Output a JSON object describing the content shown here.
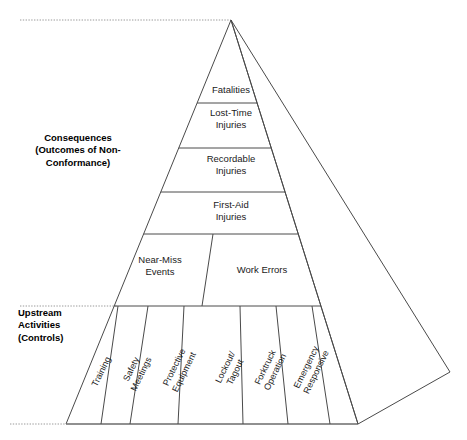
{
  "diagram": {
    "type": "pyramid",
    "line_color": "#4a4a4a",
    "guide_color": "#9a9a9a",
    "text_color": "#1a1a1a",
    "background": "#ffffff"
  },
  "side_labels": [
    {
      "name": "consequences",
      "align": "center",
      "x": 78,
      "y": 153,
      "lines": [
        "Consequences",
        "(Outcomes of Non-",
        "Conformance)"
      ]
    },
    {
      "name": "upstream",
      "align": "left",
      "x": 18,
      "y": 328,
      "lines": [
        "Upstream",
        "Activities",
        "(Controls)"
      ]
    }
  ],
  "tiers": [
    {
      "name": "fatalities",
      "lines": [
        "Fatalities"
      ],
      "cx": 231,
      "cy": 90
    },
    {
      "name": "lost-time-injuries",
      "lines": [
        "Lost-Time",
        "Injuries"
      ],
      "cx": 231,
      "cy": 119
    },
    {
      "name": "recordable-injuries",
      "lines": [
        "Recordable",
        "Injuries"
      ],
      "cx": 231,
      "cy": 165
    },
    {
      "name": "first-aid-injuries",
      "lines": [
        "First-Aid",
        "Injuries"
      ],
      "cx": 231,
      "cy": 211
    },
    {
      "name": "near-miss-events",
      "lines": [
        "Near-Miss",
        "Events"
      ],
      "cx": 160,
      "cy": 266
    },
    {
      "name": "work-errors",
      "lines": [
        "Work Errors"
      ],
      "cx": 262,
      "cy": 270
    }
  ],
  "columns": [
    {
      "name": "training",
      "lines": [
        "Training"
      ],
      "cx": 102,
      "cy": 372,
      "angle": -64
    },
    {
      "name": "safety-meetings",
      "lines": [
        "Safety",
        "Meetings"
      ],
      "cx": 137,
      "cy": 372,
      "angle": -64
    },
    {
      "name": "protective-equipment",
      "lines": [
        "Protective",
        "Equipment"
      ],
      "cx": 180,
      "cy": 370,
      "angle": -64
    },
    {
      "name": "lockout-tagout",
      "lines": [
        "Lockout/",
        "Tagout"
      ],
      "cx": 231,
      "cy": 370,
      "angle": -64
    },
    {
      "name": "forktruck-operation",
      "lines": [
        "Forktruck",
        "Operation"
      ],
      "cx": 271,
      "cy": 370,
      "angle": -64
    },
    {
      "name": "emergency-responsive",
      "lines": [
        "Emergency",
        "Responsive"
      ],
      "cx": 312,
      "cy": 370,
      "angle": -64
    }
  ],
  "geometry": {
    "apex": {
      "x": 231,
      "y": 20
    },
    "base_left": {
      "x": 66,
      "y": 424
    },
    "base_right": {
      "x": 358,
      "y": 424
    },
    "side_face_outer": {
      "x": 450,
      "y": 372
    },
    "tier_dividers_y": [
      103,
      148,
      192,
      234,
      306
    ],
    "guide_top_y": 20,
    "guide_mid_y": 306,
    "guide_base_y": 424,
    "guide_left_x": 10
  }
}
